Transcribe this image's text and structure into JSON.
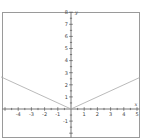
{
  "chart_data": {
    "type": "line",
    "title": "",
    "xlabel": "x",
    "ylabel": "y",
    "xlim": [
      -5.3,
      5.2
    ],
    "ylim": [
      -2,
      8
    ],
    "grid": false,
    "x_ticks": [
      -4,
      -3,
      -2,
      -1,
      1,
      2,
      3,
      4,
      5
    ],
    "y_ticks": [
      -1,
      1,
      2,
      3,
      4,
      5,
      6,
      7,
      8
    ],
    "series": [
      {
        "name": "y = |x|/2",
        "x": [
          -5.3,
          0,
          5.2
        ],
        "y": [
          2.65,
          0,
          2.6
        ],
        "color": "#a8a8a8"
      }
    ]
  },
  "colors": {
    "frame": "#9a9a9a",
    "axis": "#555555",
    "curve": "#a8a8a8"
  }
}
